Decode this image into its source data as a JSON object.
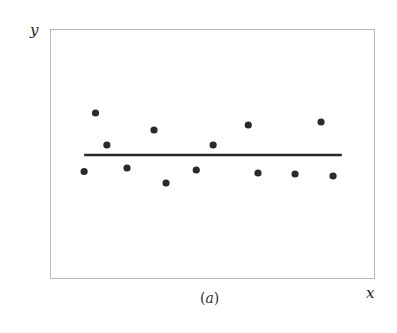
{
  "chart_data": {
    "type": "scatter",
    "title": "",
    "caption": "(a)",
    "xlabel": "x",
    "ylabel": "y",
    "grid": false,
    "legend": null,
    "xlim": [
      0,
      100
    ],
    "ylim": [
      0,
      100
    ],
    "points": [
      {
        "x": 10.5,
        "y": 43.0
      },
      {
        "x": 14.0,
        "y": 66.4
      },
      {
        "x": 17.5,
        "y": 53.6
      },
      {
        "x": 23.7,
        "y": 44.4
      },
      {
        "x": 32.0,
        "y": 59.6
      },
      {
        "x": 35.7,
        "y": 38.4
      },
      {
        "x": 45.0,
        "y": 43.6
      },
      {
        "x": 50.2,
        "y": 53.6
      },
      {
        "x": 61.0,
        "y": 61.6
      },
      {
        "x": 64.0,
        "y": 42.4
      },
      {
        "x": 75.4,
        "y": 42.0
      },
      {
        "x": 83.4,
        "y": 62.8
      },
      {
        "x": 87.1,
        "y": 41.2
      }
    ],
    "fit_line": {
      "type": "horizontal",
      "y": 49.6,
      "x_start": 10.5,
      "x_end": 89.8
    },
    "pixel_frame": {
      "left": 50,
      "top": 29,
      "right": 375,
      "bottom": 279
    }
  },
  "labels": {
    "x": "x",
    "y": "y",
    "caption_open": "(",
    "caption_letter": "a",
    "caption_close": ")",
    "edge_mark": ")"
  }
}
